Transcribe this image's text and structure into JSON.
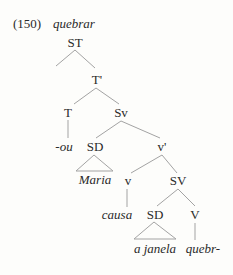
{
  "example": {
    "number": "(150)",
    "verb": "quebrar"
  },
  "tree": {
    "nodes": {
      "ST": "ST",
      "T_bar": "T'",
      "T": "T",
      "Sv": "Sv",
      "T_suffix": "-ou",
      "SD_subject": "SD",
      "v_bar": "v'",
      "subject": "Maria",
      "v": "v",
      "SV": "SV",
      "v_head": "causa",
      "SD_object": "SD",
      "V": "V",
      "object": "a janela",
      "V_root": "quebr-"
    },
    "line_color": "#9a9a9a"
  }
}
